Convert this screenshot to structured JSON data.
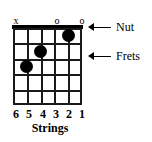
{
  "diagram": {
    "type": "guitar-chord-diagram",
    "width": 152,
    "height": 142,
    "ink_color": "#000000",
    "background_color": "#ffffff"
  },
  "top_markers": [
    {
      "string": 6,
      "symbol": "x",
      "meaning": "muted",
      "x": 16
    },
    {
      "string": 5,
      "symbol": "",
      "meaning": "fretted",
      "x": 29
    },
    {
      "string": 4,
      "symbol": "",
      "meaning": "fretted",
      "x": 43
    },
    {
      "string": 3,
      "symbol": "o",
      "meaning": "open",
      "x": 57
    },
    {
      "string": 2,
      "symbol": "",
      "meaning": "fretted",
      "x": 69
    },
    {
      "string": 1,
      "symbol": "o",
      "meaning": "open",
      "x": 82
    }
  ],
  "fretboard": {
    "string_count": 6,
    "fret_count": 5,
    "nut_shown": true,
    "string_x": [
      0,
      13.8,
      27.6,
      41.4,
      55.2,
      69
    ],
    "fret_y": [
      0,
      15.4,
      30.8,
      46.2,
      61.6,
      77
    ],
    "dots": [
      {
        "string": 2,
        "fret": 1,
        "cx": 55.2,
        "cy": 7.7
      },
      {
        "string": 4,
        "fret": 2,
        "cx": 27.6,
        "cy": 23.1
      },
      {
        "string": 5,
        "fret": 3,
        "cx": 13.8,
        "cy": 38.5
      }
    ]
  },
  "string_numbers": [
    {
      "label": "6",
      "x": 16
    },
    {
      "label": "5",
      "x": 29
    },
    {
      "label": "4",
      "x": 43
    },
    {
      "label": "3",
      "x": 56
    },
    {
      "label": "2",
      "x": 69
    },
    {
      "label": "1",
      "x": 82
    }
  ],
  "captions": {
    "strings": "Strings"
  },
  "callouts": {
    "nut": "Nut",
    "frets": "Frets"
  }
}
